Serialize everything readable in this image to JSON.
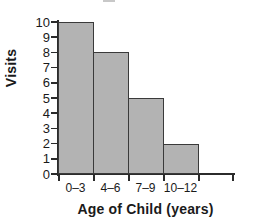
{
  "chart_data": {
    "type": "bar",
    "title": "",
    "categories": [
      "0–3",
      "4–6",
      "7–9",
      "10–12"
    ],
    "values": [
      10,
      8,
      5,
      2
    ],
    "xlabel": "Age of Child (years)",
    "ylabel": "Visits",
    "ylim": [
      0,
      10
    ],
    "y_ticks": [
      0,
      1,
      2,
      3,
      4,
      5,
      6,
      7,
      8,
      9,
      10
    ],
    "y_tick_labels": [
      "0",
      "1",
      "2",
      "3",
      "4",
      "5",
      "6",
      "7",
      "8",
      "9",
      "10"
    ],
    "grid": false,
    "legend": null,
    "bar_style": "adjacent-histogram",
    "bar_fill_color": "#b3b3b3",
    "bar_edge_color": "#3a3a3a",
    "axis_color": "#2b2b2b",
    "background_color": "#ffffff",
    "extra_unlabeled_x_tick": true,
    "annotations": []
  }
}
